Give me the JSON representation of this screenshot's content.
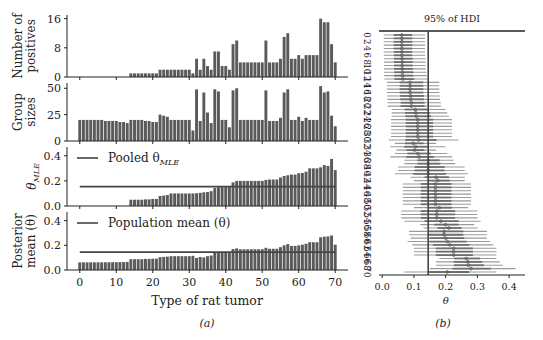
{
  "figure": {
    "left_caption": "(a)",
    "right_caption": "(b)"
  },
  "colors": {
    "bar": "#5a5a5a",
    "bar_edge": "#ffffff",
    "line": "#444444",
    "hdi_line": "#9a9a9a",
    "hdi_inner": "#6e6e6e",
    "ref_line": "#444444",
    "axis": "#222222"
  },
  "chart_data": [
    {
      "type": "bar",
      "panel": "number_of_positives",
      "ylabel": [
        "Number of",
        "positives"
      ],
      "yticks": [
        0,
        8,
        16
      ],
      "ylim": [
        0,
        17
      ],
      "xlim": [
        -3.5,
        73.5
      ],
      "xticks": [
        0,
        10,
        20,
        30,
        40,
        50,
        60,
        70
      ],
      "x": [
        0,
        1,
        2,
        3,
        4,
        5,
        6,
        7,
        8,
        9,
        10,
        11,
        12,
        13,
        14,
        15,
        16,
        17,
        18,
        19,
        20,
        21,
        22,
        23,
        24,
        25,
        26,
        27,
        28,
        29,
        30,
        31,
        32,
        33,
        34,
        35,
        36,
        37,
        38,
        39,
        40,
        41,
        42,
        43,
        44,
        45,
        46,
        47,
        48,
        49,
        50,
        51,
        52,
        53,
        54,
        55,
        56,
        57,
        58,
        59,
        60,
        61,
        62,
        63,
        64,
        65,
        66,
        67,
        68,
        69,
        70
      ],
      "values": [
        0,
        0,
        0,
        0,
        0,
        0,
        0,
        0,
        0,
        0,
        0,
        0,
        0,
        0,
        1,
        1,
        1,
        1,
        1,
        1,
        1,
        1,
        2,
        2,
        2,
        2,
        2,
        2,
        2,
        2,
        2,
        1,
        5,
        2,
        5,
        3,
        2,
        7,
        7,
        3,
        3,
        2,
        9,
        10,
        4,
        4,
        4,
        4,
        4,
        4,
        4,
        10,
        4,
        4,
        4,
        5,
        11,
        12,
        5,
        5,
        6,
        5,
        6,
        6,
        6,
        6,
        16,
        15,
        15,
        9,
        4
      ]
    },
    {
      "type": "bar",
      "panel": "group_sizes",
      "ylabel": [
        "Group",
        "sizes"
      ],
      "yticks": [
        0,
        25,
        50
      ],
      "ylim": [
        0,
        55
      ],
      "xlim": [
        -3.5,
        73.5
      ],
      "values": [
        20,
        20,
        20,
        20,
        20,
        20,
        20,
        19,
        19,
        19,
        19,
        18,
        18,
        17,
        20,
        20,
        20,
        20,
        19,
        19,
        18,
        18,
        25,
        24,
        23,
        20,
        20,
        20,
        20,
        20,
        20,
        10,
        49,
        19,
        46,
        27,
        17,
        49,
        47,
        20,
        20,
        13,
        48,
        50,
        20,
        20,
        20,
        20,
        20,
        20,
        20,
        48,
        19,
        19,
        19,
        22,
        46,
        49,
        20,
        20,
        23,
        19,
        22,
        20,
        20,
        20,
        52,
        46,
        47,
        24,
        14
      ]
    },
    {
      "type": "bar",
      "panel": "theta_mle",
      "ylabel": "θ_MLE",
      "yticks": [
        0.0,
        0.2,
        0.4
      ],
      "ytick_labels": [
        "0.0",
        "0.2",
        "0.4"
      ],
      "ylim": [
        0,
        0.47
      ],
      "xlim": [
        -3.5,
        73.5
      ],
      "legend": "Pooled θ_MLE",
      "reference_line": 0.154,
      "values": [
        0,
        0,
        0,
        0,
        0,
        0,
        0,
        0,
        0,
        0,
        0,
        0,
        0,
        0,
        0.05,
        0.05,
        0.05,
        0.05,
        0.053,
        0.053,
        0.056,
        0.056,
        0.08,
        0.083,
        0.087,
        0.1,
        0.1,
        0.1,
        0.1,
        0.1,
        0.1,
        0.1,
        0.102,
        0.105,
        0.109,
        0.111,
        0.118,
        0.143,
        0.149,
        0.15,
        0.15,
        0.154,
        0.188,
        0.2,
        0.2,
        0.2,
        0.2,
        0.2,
        0.2,
        0.2,
        0.2,
        0.208,
        0.211,
        0.211,
        0.211,
        0.227,
        0.239,
        0.245,
        0.25,
        0.25,
        0.261,
        0.263,
        0.273,
        0.3,
        0.3,
        0.3,
        0.308,
        0.326,
        0.319,
        0.375,
        0.286
      ]
    },
    {
      "type": "bar",
      "panel": "posterior_mean",
      "ylabel": [
        "Posterior",
        "mean (θ)"
      ],
      "yticks": [
        0.0,
        0.2,
        0.4
      ],
      "ytick_labels": [
        "0.0",
        "0.2",
        "0.4"
      ],
      "ylim": [
        0,
        0.47
      ],
      "xlim": [
        -3.5,
        73.5
      ],
      "xlabel": "Type of rat tumor",
      "xtick_labels": [
        "0",
        "10",
        "20",
        "30",
        "40",
        "50",
        "60",
        "70"
      ],
      "legend": "Population mean (θ)",
      "reference_line": 0.145,
      "values": [
        0.062,
        0.062,
        0.062,
        0.062,
        0.062,
        0.062,
        0.062,
        0.063,
        0.063,
        0.063,
        0.063,
        0.064,
        0.064,
        0.065,
        0.088,
        0.088,
        0.088,
        0.088,
        0.09,
        0.09,
        0.092,
        0.092,
        0.104,
        0.106,
        0.108,
        0.112,
        0.112,
        0.112,
        0.112,
        0.112,
        0.112,
        0.115,
        0.098,
        0.105,
        0.102,
        0.112,
        0.117,
        0.145,
        0.145,
        0.145,
        0.145,
        0.145,
        0.17,
        0.175,
        0.168,
        0.168,
        0.168,
        0.168,
        0.168,
        0.168,
        0.168,
        0.18,
        0.172,
        0.172,
        0.172,
        0.185,
        0.2,
        0.21,
        0.195,
        0.195,
        0.2,
        0.205,
        0.213,
        0.225,
        0.225,
        0.225,
        0.265,
        0.27,
        0.272,
        0.28,
        0.205
      ]
    },
    {
      "type": "forest",
      "panel": "hdi",
      "title": "95% of HDI",
      "xlabel": "θ",
      "xticks": [
        0.0,
        0.1,
        0.2,
        0.3,
        0.4
      ],
      "xtick_labels": [
        "0.0",
        "0.1",
        "0.2",
        "0.3",
        "0.4"
      ],
      "xlim": [
        -0.01,
        0.45
      ],
      "ytick_labels": [
        "0",
        "2",
        "4",
        "6",
        "8",
        "10",
        "12",
        "14",
        "16",
        "18",
        "20",
        "22",
        "24",
        "26",
        "28",
        "30",
        "32",
        "34",
        "36",
        "38",
        "40",
        "42",
        "44",
        "46",
        "48",
        "50",
        "52",
        "54",
        "56",
        "58",
        "60",
        "62",
        "64",
        "66",
        "68",
        "70"
      ],
      "reference_line": 0.145,
      "means": [
        0.062,
        0.062,
        0.062,
        0.062,
        0.062,
        0.062,
        0.062,
        0.063,
        0.063,
        0.063,
        0.063,
        0.064,
        0.064,
        0.065,
        0.088,
        0.088,
        0.088,
        0.088,
        0.09,
        0.09,
        0.092,
        0.092,
        0.104,
        0.106,
        0.108,
        0.112,
        0.112,
        0.112,
        0.112,
        0.112,
        0.112,
        0.115,
        0.098,
        0.105,
        0.102,
        0.112,
        0.117,
        0.145,
        0.145,
        0.145,
        0.145,
        0.145,
        0.17,
        0.175,
        0.168,
        0.168,
        0.168,
        0.168,
        0.168,
        0.168,
        0.168,
        0.18,
        0.172,
        0.172,
        0.172,
        0.185,
        0.2,
        0.21,
        0.195,
        0.195,
        0.2,
        0.205,
        0.213,
        0.225,
        0.225,
        0.225,
        0.265,
        0.27,
        0.272,
        0.28,
        0.205
      ],
      "hdi_low": [
        0.005,
        0.005,
        0.005,
        0.005,
        0.005,
        0.005,
        0.005,
        0.006,
        0.006,
        0.006,
        0.006,
        0.006,
        0.006,
        0.007,
        0.015,
        0.015,
        0.015,
        0.015,
        0.016,
        0.016,
        0.017,
        0.017,
        0.03,
        0.03,
        0.03,
        0.028,
        0.028,
        0.028,
        0.028,
        0.028,
        0.028,
        0.02,
        0.04,
        0.025,
        0.045,
        0.04,
        0.025,
        0.07,
        0.07,
        0.05,
        0.05,
        0.04,
        0.09,
        0.1,
        0.065,
        0.065,
        0.065,
        0.065,
        0.065,
        0.065,
        0.065,
        0.1,
        0.06,
        0.06,
        0.06,
        0.07,
        0.12,
        0.13,
        0.085,
        0.085,
        0.09,
        0.08,
        0.095,
        0.1,
        0.1,
        0.1,
        0.18,
        0.17,
        0.17,
        0.15,
        0.07
      ],
      "hdi_high": [
        0.135,
        0.135,
        0.135,
        0.135,
        0.135,
        0.135,
        0.135,
        0.137,
        0.137,
        0.137,
        0.137,
        0.14,
        0.14,
        0.145,
        0.18,
        0.18,
        0.18,
        0.18,
        0.182,
        0.182,
        0.185,
        0.185,
        0.2,
        0.205,
        0.21,
        0.22,
        0.22,
        0.22,
        0.22,
        0.22,
        0.22,
        0.24,
        0.17,
        0.2,
        0.17,
        0.205,
        0.22,
        0.225,
        0.23,
        0.26,
        0.26,
        0.27,
        0.26,
        0.26,
        0.28,
        0.28,
        0.28,
        0.28,
        0.28,
        0.28,
        0.28,
        0.27,
        0.3,
        0.3,
        0.3,
        0.31,
        0.29,
        0.3,
        0.33,
        0.33,
        0.33,
        0.34,
        0.35,
        0.36,
        0.36,
        0.36,
        0.36,
        0.37,
        0.38,
        0.42,
        0.36
      ]
    }
  ]
}
